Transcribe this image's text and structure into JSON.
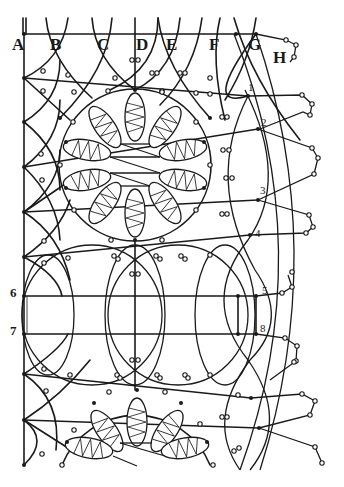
{
  "diagram": {
    "type": "lace pattern pricking diagram",
    "ink_color": "#1a1a1a",
    "background_color": "#ffffff",
    "column_labels": [
      "A",
      "B",
      "C",
      "D",
      "E",
      "F",
      "G",
      "H"
    ],
    "point_labels": {
      "p1": "1",
      "p2": "2",
      "p3": "3",
      "p4": "4",
      "p5": "5",
      "p6": "6",
      "p7": "7",
      "p8": "8"
    },
    "motifs": [
      {
        "name": "upper-flower",
        "petals": 10
      },
      {
        "name": "lower-flower",
        "petals": 5,
        "partial": true
      }
    ]
  }
}
